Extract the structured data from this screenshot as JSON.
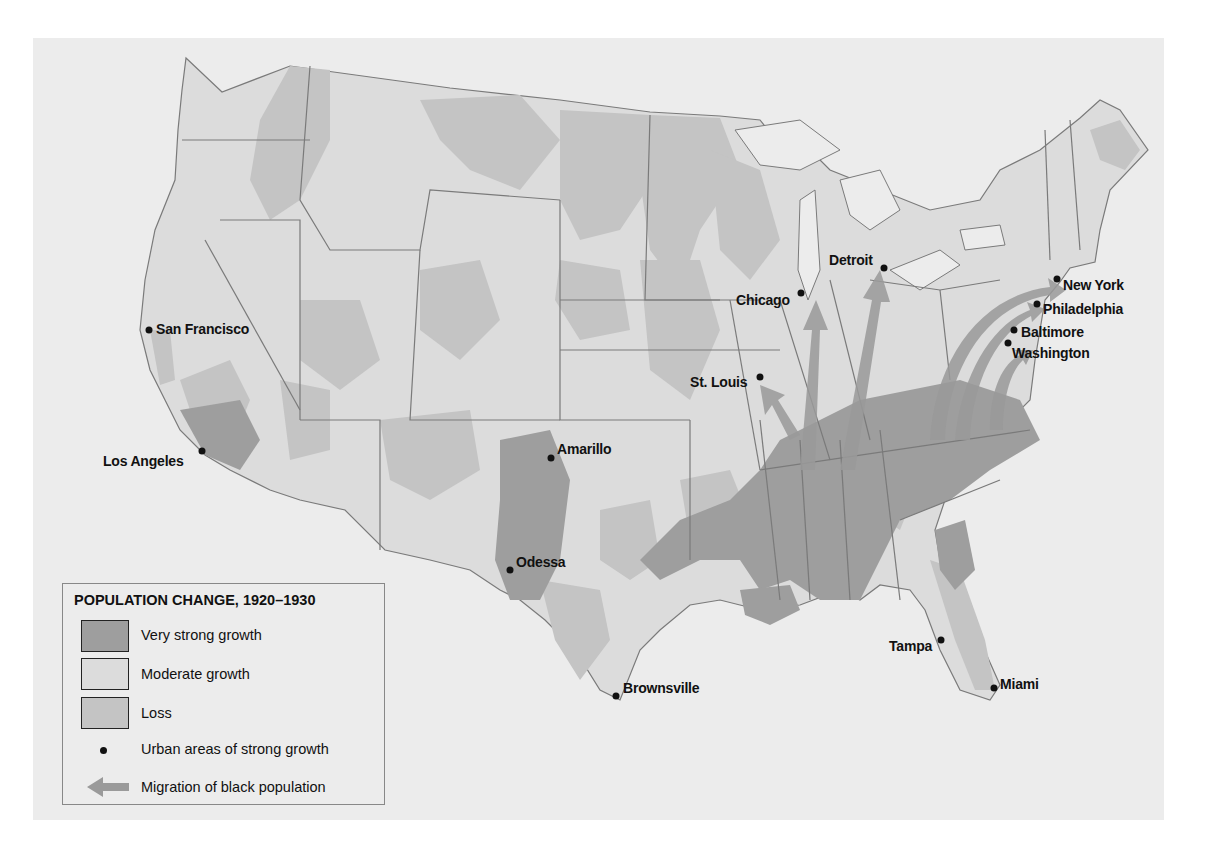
{
  "legend": {
    "title": "POPULATION CHANGE, 1920–1930",
    "items": [
      {
        "label": "Very strong growth",
        "type": "swatch",
        "color": "#9e9e9e"
      },
      {
        "label": "Moderate growth",
        "type": "swatch",
        "color": "#dcdcdc"
      },
      {
        "label": "Loss",
        "type": "swatch",
        "color": "#c4c4c4"
      },
      {
        "label": "Urban areas of strong growth",
        "type": "dot",
        "color": "#111111"
      },
      {
        "label": "Migration of black population",
        "type": "arrow",
        "color": "#9a9a9a"
      }
    ]
  },
  "colors": {
    "background": "#ececec",
    "moderate": "#dcdcdc",
    "loss": "#c4c4c4",
    "very_strong": "#9e9e9e",
    "water": "#ececec",
    "border": "#7a7a7a",
    "migration_arrow": "#9a9a9a"
  },
  "cities": [
    {
      "name": "San Francisco",
      "dot": [
        149,
        330
      ],
      "label": [
        156,
        321
      ]
    },
    {
      "name": "Los Angeles",
      "dot": [
        202,
        451
      ],
      "label": [
        103,
        454
      ]
    },
    {
      "name": "Amarillo",
      "dot": [
        551,
        458
      ],
      "label": [
        557,
        442
      ]
    },
    {
      "name": "Odessa",
      "dot": [
        510,
        570
      ],
      "label": [
        516,
        555
      ]
    },
    {
      "name": "Brownsville",
      "dot": [
        616,
        696
      ],
      "label": [
        623,
        681
      ]
    },
    {
      "name": "St. Louis",
      "dot": [
        760,
        377
      ],
      "label": [
        690,
        377
      ]
    },
    {
      "name": "Chicago",
      "dot": [
        801,
        293
      ],
      "label": [
        736,
        294
      ]
    },
    {
      "name": "Detroit",
      "dot": [
        884,
        268
      ],
      "label": [
        829,
        253
      ]
    },
    {
      "name": "New York",
      "dot": [
        1057,
        279
      ],
      "label": [
        1063,
        277
      ]
    },
    {
      "name": "Philadelphia",
      "dot": [
        1037,
        304
      ],
      "label": [
        1043,
        303
      ]
    },
    {
      "name": "Baltimore",
      "dot": [
        1014,
        330
      ],
      "label": [
        1021,
        325
      ]
    },
    {
      "name": "Washington",
      "dot": [
        1008,
        343
      ],
      "label": [
        1012,
        346
      ]
    },
    {
      "name": "Tampa",
      "dot": [
        941,
        640
      ],
      "label": [
        889,
        640
      ]
    },
    {
      "name": "Miami",
      "dot": [
        994,
        688
      ],
      "label": [
        1000,
        677
      ]
    }
  ]
}
